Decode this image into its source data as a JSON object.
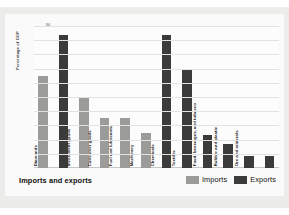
{
  "chart_data": {
    "type": "bar",
    "title": "Imports and exports",
    "xlabel": "",
    "ylabel": "Percentage of GDP",
    "ylim": [
      0,
      30
    ],
    "yticks": [
      0,
      3,
      6,
      9,
      12,
      15,
      18,
      21,
      24,
      27,
      30
    ],
    "grid": true,
    "legend_position": "bottom-right",
    "legend": [
      "Imports",
      "Exports"
    ],
    "colors": {
      "imports": "#9b9b99",
      "exports": "#3b3b3b",
      "gridline": "#e2e2e0",
      "panel": "#ececea",
      "card": "#fafafa"
    },
    "bars": [
      {
        "category": "Diamonds",
        "series": "Imports",
        "value": 19.5
      },
      {
        "category": "Diamonds",
        "series": "Exports",
        "value": 28.0
      },
      {
        "category": "Investment goods",
        "series": "Imports",
        "value": 14.8
      },
      {
        "category": "Consumer goods",
        "series": "Imports",
        "value": 10.5
      },
      {
        "category": "Fuel and lubricants",
        "series": "Imports",
        "value": 10.5
      },
      {
        "category": "Machinery",
        "series": "Imports",
        "value": 7.3
      },
      {
        "category": "Machinery",
        "series": "Exports",
        "value": 28.0
      },
      {
        "category": "Chemicals",
        "series": "Exports",
        "value": 21.0
      },
      {
        "category": "Textiles",
        "series": "Exports",
        "value": 7.0
      },
      {
        "category": "Food, beverages, and tobacco",
        "series": "Exports",
        "value": 5.0
      },
      {
        "category": "Rubber and plastic",
        "series": "Exports",
        "value": 2.5
      },
      {
        "category": "Ore and minerals",
        "series": "Exports",
        "value": 2.5
      }
    ],
    "categories": [
      "Diamonds",
      "Investment goods",
      "Consumer goods",
      "Fuel and lubricants",
      "Machinery",
      "Chemicals",
      "Textiles",
      "Food, beverages, and tobacco",
      "Rubber and plastic",
      "Ore and minerals"
    ],
    "category_labels": [
      {
        "text": "Diamonds",
        "left": 4
      },
      {
        "text": "Investment goods",
        "left": 37
      },
      {
        "text": "Consumer goods",
        "left": 58
      },
      {
        "text": "Fuel and lubricants",
        "left": 79
      },
      {
        "text": "Machinery",
        "left": 100
      },
      {
        "text": "Chemicals",
        "left": 121
      },
      {
        "text": "Textiles",
        "left": 142
      },
      {
        "text": "Food, beverages, and tobacco",
        "left": 163
      },
      {
        "text": "Rubber and plastic",
        "left": 184
      },
      {
        "text": "Ore and minerals",
        "left": 205
      }
    ]
  }
}
